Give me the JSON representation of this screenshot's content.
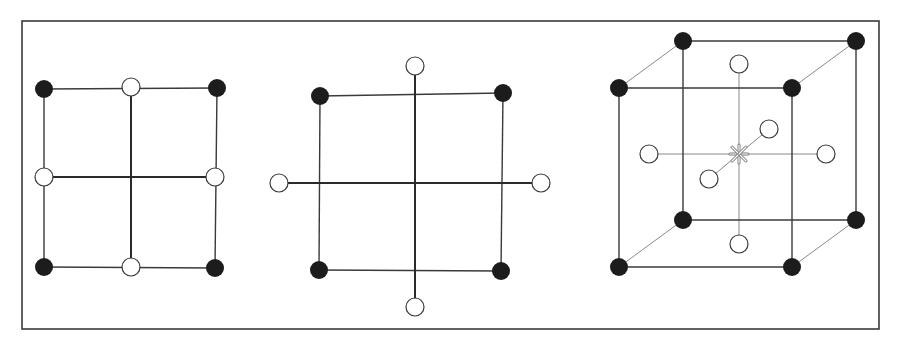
{
  "figure": {
    "colors": {
      "background": "#ffffff",
      "frame": "#3a3a3a",
      "line": "#3a3a3a",
      "thin_line": "#8a8a8a",
      "factorial_point": "#1c1c1c",
      "axial_point_fill": "#ffffff",
      "axial_point_stroke": "#3a3a3a",
      "center_point": "#7a7a7a"
    },
    "frame": {
      "x": 22,
      "y": 21,
      "width": 857,
      "height": 308
    },
    "panels": [
      {
        "id": "face-centered-2d",
        "factorial_points": [
          [
            44,
            89
          ],
          [
            217,
            88
          ],
          [
            44,
            267
          ],
          [
            215,
            268
          ]
        ],
        "axial_points": [
          [
            131,
            87
          ],
          [
            44,
            177
          ],
          [
            215,
            177
          ],
          [
            131,
            267
          ]
        ],
        "lines": [
          [
            44,
            89,
            217,
            88
          ],
          [
            217,
            88,
            215,
            268
          ],
          [
            215,
            268,
            44,
            267
          ],
          [
            44,
            267,
            44,
            89
          ],
          [
            131,
            87,
            131,
            267
          ],
          [
            44,
            177,
            215,
            177
          ]
        ],
        "bold_lines": [
          [
            131,
            87,
            131,
            267
          ],
          [
            44,
            177,
            215,
            177
          ]
        ]
      },
      {
        "id": "circumscribed-ccd-2d",
        "factorial_points": [
          [
            320,
            96
          ],
          [
            503,
            93
          ],
          [
            319,
            270
          ],
          [
            501,
            271
          ]
        ],
        "axial_points": [
          [
            415,
            66
          ],
          [
            279,
            183
          ],
          [
            541,
            183
          ],
          [
            415,
            307
          ]
        ],
        "lines": [
          [
            320,
            96,
            503,
            93
          ],
          [
            503,
            93,
            501,
            271
          ],
          [
            501,
            271,
            319,
            270
          ],
          [
            319,
            270,
            320,
            96
          ]
        ],
        "bold_lines": [
          [
            415,
            66,
            415,
            307
          ],
          [
            279,
            183,
            541,
            183
          ]
        ]
      },
      {
        "id": "ccd-3d",
        "factorial_points": [
          [
            619,
            88
          ],
          [
            792,
            88
          ],
          [
            619,
            267
          ],
          [
            792,
            267
          ],
          [
            683,
            41
          ],
          [
            856,
            41
          ],
          [
            683,
            220
          ],
          [
            856,
            220
          ]
        ],
        "axial_points": [
          [
            739,
            64
          ],
          [
            739,
            244
          ],
          [
            649,
            154
          ],
          [
            826,
            154
          ],
          [
            769,
            129
          ],
          [
            709,
            179
          ]
        ],
        "center_point": [
          739,
          154
        ],
        "lines": [
          [
            619,
            88,
            792,
            88
          ],
          [
            792,
            88,
            792,
            267
          ],
          [
            792,
            267,
            619,
            267
          ],
          [
            619,
            267,
            619,
            88
          ],
          [
            683,
            41,
            856,
            41
          ],
          [
            856,
            41,
            856,
            220
          ],
          [
            856,
            220,
            683,
            220
          ],
          [
            683,
            220,
            683,
            41
          ]
        ],
        "thin_lines": [
          [
            619,
            88,
            683,
            41
          ],
          [
            792,
            88,
            856,
            41
          ],
          [
            619,
            267,
            683,
            220
          ],
          [
            792,
            267,
            856,
            220
          ],
          [
            739,
            64,
            739,
            244
          ],
          [
            649,
            154,
            826,
            154
          ],
          [
            709,
            179,
            769,
            129
          ]
        ]
      }
    ],
    "point_radius": 9
  }
}
